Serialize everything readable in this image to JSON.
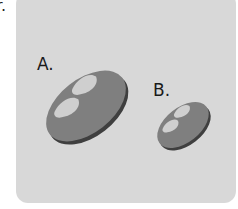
{
  "cut_label": "r.",
  "options": [
    {
      "label": "A.",
      "item": "bread-loaf",
      "size": "large"
    },
    {
      "label": "B.",
      "item": "bread-loaf",
      "size": "small"
    }
  ],
  "colors": {
    "panel": "#d8d8d8",
    "loaf_top": "#7f7f7f",
    "loaf_side": "#3f3f3f",
    "score_marks": "#cfcfcf"
  }
}
